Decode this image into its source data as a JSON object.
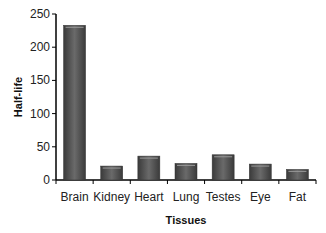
{
  "chart_data": {
    "type": "bar",
    "title": "",
    "xlabel": "Tissues",
    "ylabel": "Half-life",
    "categories": [
      "Brain",
      "Kidney",
      "Heart",
      "Lung",
      "Testes",
      "Eye",
      "Fat"
    ],
    "values": [
      233,
      21,
      36,
      25,
      38,
      24,
      16
    ],
    "ylim": [
      0,
      250
    ],
    "yticks": [
      0,
      50,
      100,
      150,
      200,
      250
    ],
    "grid": false,
    "legend": null,
    "bar_color": "#555555"
  }
}
